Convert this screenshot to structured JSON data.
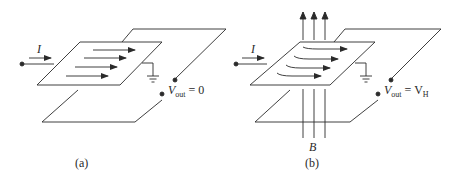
{
  "figure": {
    "panels": [
      {
        "id": "a",
        "caption": "(a)",
        "current_label": "I",
        "vout_symbol": "V",
        "vout_sub": "out",
        "vout_eq": "= 0",
        "current_flow": "straight",
        "magnetic_field": false
      },
      {
        "id": "b",
        "caption": "(b)",
        "current_label": "I",
        "vout_symbol": "V",
        "vout_sub": "out",
        "vout_eq": "= V",
        "vout_eq_sub": "H",
        "field_label": "B",
        "current_flow": "deflected",
        "magnetic_field": true
      }
    ],
    "colors": {
      "line": "#2a2a2a",
      "background": "#ffffff"
    }
  }
}
